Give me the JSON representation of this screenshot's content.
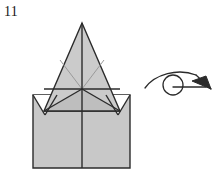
{
  "figure": {
    "step_label": "11",
    "caption": "",
    "type": "origami-fold-diagram",
    "colors": {
      "paper_fill": "#c8c8c8",
      "paper_fill_light": "#d2d2d2",
      "paper_fill_shade": "#bdbdbd",
      "outline": "#2b2b2b",
      "soft_crease": "#8f8f8f",
      "arrow": "#2b2b2b",
      "background": "#ffffff"
    },
    "shapes": {
      "square_base": {
        "name": "square-base",
        "points": "33,95 130,95 130,168 33,168"
      },
      "left_notch": {
        "name": "left-corner-notch",
        "points": "33,95 57,95 45,115"
      },
      "right_notch": {
        "name": "right-corner-notch",
        "points": "106,95 130,95 118,115"
      },
      "main_triangle": {
        "name": "main-triangle",
        "points": "82,23 120,111 44,111"
      },
      "left_flap": {
        "name": "left-flap",
        "points": "44,111 82,89 82,111"
      },
      "right_flap": {
        "name": "right-flap",
        "points": "120,111 82,89 82,111"
      }
    },
    "creases": {
      "vertical_center": {
        "name": "vertical-center-crease",
        "d": "M 82 23 L 82 168"
      },
      "horizontal_fold": {
        "name": "horizontal-fold-line",
        "d": "M 44 89 L 120 89"
      },
      "base_fold": {
        "name": "base-fold-line",
        "d": "M 44 111 L 120 111"
      },
      "left_diagonal": {
        "name": "left-diagonal-crease",
        "d": "M 82 89 L 44 111"
      },
      "right_diagonal": {
        "name": "right-diagonal-crease",
        "d": "M 82 89 L 120 111"
      },
      "soft_left": {
        "name": "soft-left-crease",
        "d": "M 82 89 L 60 60"
      },
      "soft_right": {
        "name": "soft-right-crease",
        "d": "M 82 89 L 104 60"
      },
      "left_notch_edge_a": {
        "name": "left-notch-edge-a",
        "d": "M 33 95 L 45 115"
      },
      "left_notch_edge_b": {
        "name": "left-notch-edge-b",
        "d": "M 45 115 L 57 95"
      },
      "right_notch_edge_a": {
        "name": "right-notch-edge-a",
        "d": "M 106 95 L 118 115"
      },
      "right_notch_edge_b": {
        "name": "right-notch-edge-b",
        "d": "M 118 115 L 130 95"
      }
    },
    "arrow": {
      "name": "turn-over-arrow",
      "meaning": "turn the model over",
      "curve": "M 145 88 C 155 74 178 68 196 75",
      "shaft": "M 196 75 L 211 89",
      "head": "211,89 192,81 206,76",
      "tail_line": "M 173 87 L 206 87",
      "circle": {
        "cx": 173,
        "cy": 85,
        "r": 10
      }
    }
  }
}
